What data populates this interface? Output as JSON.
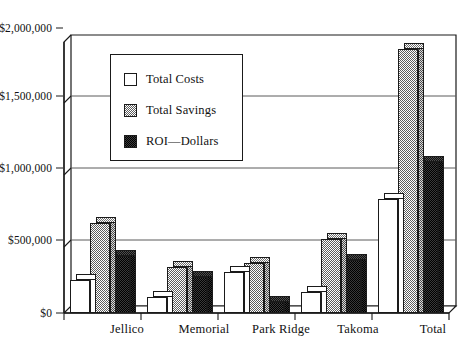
{
  "chart_data": {
    "type": "bar",
    "title": "",
    "subtitle": "",
    "xlabel": "",
    "ylabel": "",
    "categories": [
      "Jellico",
      "Memorial",
      "Park  Ridge",
      "Takoma",
      "Total"
    ],
    "series": [
      {
        "name": "Total Costs",
        "values": [
          230000,
          110000,
          290000,
          145000,
          800000
        ]
      },
      {
        "name": "Total Savings",
        "values": [
          630000,
          320000,
          350000,
          520000,
          1850000
        ]
      },
      {
        "name": "ROI—Dollars",
        "values": [
          400000,
          250000,
          75000,
          375000,
          1060000
        ]
      }
    ],
    "ylim": [
      0,
      2000000
    ],
    "ytick_values": [
      0,
      500000,
      1000000,
      1500000,
      2000000
    ],
    "ytick_labels": [
      "$0",
      "$500,000",
      "$1,000,000",
      "$1,500,000",
      "$2,000,000"
    ],
    "grid": true,
    "grid_axis": "y",
    "legend_position": "upper-left-inside",
    "style": "3d-perspective-columns",
    "colors": {
      "total_costs": "#ffffff",
      "total_savings": "#6e6e6e",
      "roi_dollars": "#171717",
      "axis": "#1a1a1a",
      "gridline": "#5a5a5a",
      "background": "#ffffff"
    }
  },
  "legend": {
    "items": [
      {
        "label": "Total Costs",
        "swatch": "swatch-white"
      },
      {
        "label": "Total Savings",
        "swatch": "swatch-gray-dither"
      },
      {
        "label": "ROI—Dollars",
        "swatch": "swatch-black-dither"
      }
    ]
  }
}
